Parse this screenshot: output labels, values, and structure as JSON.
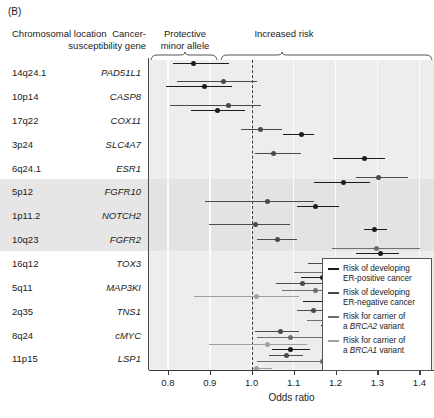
{
  "panel_label": "(B)",
  "headers": {
    "chromosomal_location": "Chromosomal location",
    "cancer_gene": "Cancer-susceptibility gene",
    "protective": "Protective minor allele",
    "increased": "Increased risk"
  },
  "axis": {
    "xlabel": "Odds ratio",
    "ticks": [
      "0.8",
      "0.9",
      "1.0",
      "1.1",
      "1.2",
      "1.3",
      "1.4"
    ],
    "tick_values": [
      0.8,
      0.9,
      1.0,
      1.1,
      1.2,
      1.3,
      1.4
    ],
    "xlim": [
      0.755,
      1.435
    ],
    "reference_line": 1.0
  },
  "legend": {
    "items": [
      {
        "label_line1": "Risk of developing",
        "label_line2": "ER-positive cancer",
        "color": "#1c1c1c"
      },
      {
        "label_line1": "Risk of developing",
        "label_line2": "ER-negative cancer",
        "color": "#4a4a4a"
      },
      {
        "label_line1": "Risk for carrier of",
        "label_line2_pre": "a ",
        "label_line2_em": "BRCA2",
        "label_line2_post": " variant",
        "color": "#6e6e6e"
      },
      {
        "label_line1": "Risk for carrier of",
        "label_line2_pre": "a ",
        "label_line2_em": "BRCA1",
        "label_line2_post": " variant",
        "color": "#a0a0a0"
      }
    ]
  },
  "colors": {
    "er_positive": "#1c1c1c",
    "er_negative": "#4a4a4a",
    "brca2": "#6e6e6e",
    "brca1": "#a0a0a0",
    "plot_background": "#ededed",
    "band_shade": "#e3e3e3",
    "gridline": "#fbfbfb",
    "axis": "#3a3a3a"
  },
  "chart_data": {
    "type": "scatter",
    "xlabel": "Odds ratio",
    "ylabel": "",
    "xlim": [
      0.755,
      1.435
    ],
    "grid": true,
    "legend_position": "right-bottom",
    "reference_line": 1.0,
    "categories": [
      "14q24.1",
      "10p14",
      "17q22",
      "3p24",
      "6q24.1",
      "5p12",
      "1p11.2",
      "10q23",
      "16q12",
      "5q11",
      "2q35",
      "8q24",
      "11p15"
    ],
    "genes": [
      "PAD51L1",
      "CASP8",
      "COX11",
      "SLC4A7",
      "ESR1",
      "FGFR10",
      "NOTCH2",
      "FGFR2",
      "TOX3",
      "MAP3KI",
      "TNS1",
      "cMYC",
      "LSP1"
    ],
    "shaded_rows": [
      "5p12",
      "1p11.2",
      "10q23"
    ],
    "series": [
      {
        "name": "Risk of developing ER-positive cancer",
        "color": "#1c1c1c"
      },
      {
        "name": "Risk of developing ER-negative cancer",
        "color": "#4a4a4a"
      },
      {
        "name": "Risk for carrier of a BRCA2 variant",
        "color": "#6e6e6e"
      },
      {
        "name": "Risk for carrier of a BRCA1 variant",
        "color": "#a0a0a0"
      }
    ],
    "rows": [
      {
        "location": "14q24.1",
        "gene": "PAD51L1",
        "shaded": false,
        "points": [
          {
            "series": 0,
            "or": 0.862,
            "lo": 0.812,
            "hi": 0.946
          },
          {
            "series": 1,
            "or": 0.933,
            "lo": 0.822,
            "hi": 1.013
          }
        ]
      },
      {
        "location": "10p14",
        "gene": "CASP8",
        "shaded": false,
        "points": [
          {
            "series": 0,
            "or": 0.888,
            "lo": 0.795,
            "hi": 0.952
          },
          {
            "series": 1,
            "or": 0.945,
            "lo": 0.805,
            "hi": 1.022
          }
        ]
      },
      {
        "location": "17q22",
        "gene": "COX11",
        "shaded": false,
        "points": [
          {
            "series": 0,
            "or": 0.918,
            "lo": 0.855,
            "hi": 0.985
          },
          {
            "series": 1,
            "or": 1.022,
            "lo": 0.975,
            "hi": 1.072
          }
        ]
      },
      {
        "location": "3p24",
        "gene": "SLC4A7",
        "shaded": false,
        "points": [
          {
            "series": 0,
            "or": 1.118,
            "lo": 1.075,
            "hi": 1.148
          },
          {
            "series": 1,
            "or": 1.052,
            "lo": 1.008,
            "hi": 1.118
          }
        ]
      },
      {
        "location": "6q24.1",
        "gene": "ESR1",
        "shaded": false,
        "points": [
          {
            "series": 0,
            "or": 1.268,
            "lo": 1.195,
            "hi": 1.318
          },
          {
            "series": 1,
            "or": 1.302,
            "lo": 1.248,
            "hi": 1.372
          }
        ]
      },
      {
        "location": "5p12",
        "gene": "FGFR10",
        "shaded": true,
        "points": [
          {
            "series": 0,
            "or": 1.218,
            "lo": 1.148,
            "hi": 1.282
          },
          {
            "series": 1,
            "or": 1.038,
            "lo": 0.888,
            "hi": 1.148
          }
        ]
      },
      {
        "location": "1p11.2",
        "gene": "NOTCH2",
        "shaded": true,
        "points": [
          {
            "series": 0,
            "or": 1.152,
            "lo": 1.108,
            "hi": 1.208
          },
          {
            "series": 1,
            "or": 1.008,
            "lo": 0.898,
            "hi": 1.092
          }
        ]
      },
      {
        "location": "10q23",
        "gene": "FGFR2",
        "shaded": true,
        "points": [
          {
            "series": 0,
            "or": 1.292,
            "lo": 1.268,
            "hi": 1.322
          },
          {
            "series": 1,
            "or": 1.062,
            "lo": 1.012,
            "hi": 1.108
          },
          {
            "series": 2,
            "or": 1.298,
            "lo": 1.192,
            "hi": 1.402
          }
        ]
      },
      {
        "location": "16q12",
        "gene": "TOX3",
        "shaded": false,
        "points": [
          {
            "series": 0,
            "or": 1.308,
            "lo": 1.248,
            "hi": 1.352
          },
          {
            "series": 1,
            "or": 1.195,
            "lo": 1.135,
            "hi": 1.268
          },
          {
            "series": 2,
            "or": 1.212,
            "lo": 1.102,
            "hi": 1.308
          }
        ]
      },
      {
        "location": "5q11",
        "gene": "MAP3KI",
        "shaded": false,
        "points": [
          {
            "series": 0,
            "or": 1.168,
            "lo": 1.118,
            "hi": 1.218
          },
          {
            "series": 1,
            "or": 1.122,
            "lo": 1.058,
            "hi": 1.195
          },
          {
            "series": 2,
            "or": 1.152,
            "lo": 1.072,
            "hi": 1.272
          },
          {
            "series": 3,
            "or": 1.012,
            "lo": 0.862,
            "hi": 1.112
          }
        ]
      },
      {
        "location": "2q35",
        "gene": "TNS1",
        "shaded": false,
        "points": [
          {
            "series": 0,
            "or": 1.192,
            "lo": 1.122,
            "hi": 1.238
          },
          {
            "series": 1,
            "or": 1.148,
            "lo": 1.108,
            "hi": 1.192
          },
          {
            "series": 2,
            "or": 1.228,
            "lo": 1.132,
            "hi": 1.352
          }
        ]
      },
      {
        "location": "8q24",
        "gene": "cMYC",
        "shaded": false,
        "points": [
          {
            "series": 0,
            "or": 1.218,
            "lo": 1.165,
            "hi": 1.272
          },
          {
            "series": 1,
            "or": 1.068,
            "lo": 1.008,
            "hi": 1.112
          },
          {
            "series": 2,
            "or": 1.092,
            "lo": 1.012,
            "hi": 1.168
          },
          {
            "series": 3,
            "or": 1.038,
            "lo": 0.898,
            "hi": 1.132
          }
        ]
      },
      {
        "location": "11p15",
        "gene": "LSP1",
        "shaded": false,
        "points": [
          {
            "series": 0,
            "or": 1.092,
            "lo": 1.048,
            "hi": 1.138
          },
          {
            "series": 1,
            "or": 1.082,
            "lo": 1.042,
            "hi": 1.122
          },
          {
            "series": 2,
            "or": 1.168,
            "lo": 1.012,
            "hi": 1.248
          },
          {
            "series": 3,
            "or": 1.012,
            "lo": 1.002,
            "hi": 1.048
          }
        ]
      }
    ]
  }
}
